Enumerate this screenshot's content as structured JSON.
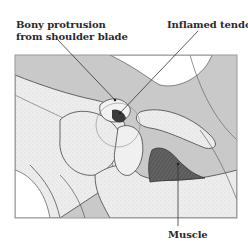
{
  "labels": {
    "bony_protrusion_line1": "Bony protrusion",
    "bony_protrusion_line2": "from shoulder blade",
    "inflamed_tendon": "Inflamed tendon",
    "muscle": "Muscle"
  },
  "colors": {
    "background": "#ffffff",
    "tissue_gray": "#c9c9c9",
    "bone_light": "#ececec",
    "muscle_dark": "#5a5a5a",
    "outline": "#555555",
    "frame": "#9a9a9a"
  }
}
